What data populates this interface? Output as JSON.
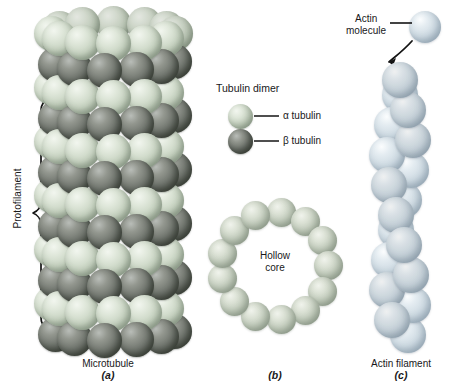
{
  "figure": {
    "type": "biology-diagram",
    "background": "#ffffff"
  },
  "panels": [
    {
      "id": "a",
      "letter": "(a)",
      "caption": "Microtubule"
    },
    {
      "id": "b",
      "letter": "(b)",
      "caption": ""
    },
    {
      "id": "c",
      "letter": "(c)",
      "caption": "Actin filament"
    }
  ],
  "microtubule": {
    "annotation": "Protofilament",
    "bracket": "curly-brace",
    "rows": 12,
    "columns": 6,
    "subunit_pattern": "alternating alpha and beta tubulin rows"
  },
  "legend": {
    "title": "Tubulin dimer",
    "items": [
      {
        "label": "α tubulin",
        "color": "#c6d2c0",
        "name": "alpha-tubulin"
      },
      {
        "label": "β tubulin",
        "color": "#6e736c",
        "name": "beta-tubulin"
      }
    ]
  },
  "cross_section": {
    "label_line1": "Hollow",
    "label_line2": "core",
    "subunit_count": 13,
    "color": "#c3cdbd"
  },
  "actin_filament": {
    "molecule_label_line1": "Actin",
    "molecule_label_line2": "molecule",
    "arrow": "curved-arrow-incorporation",
    "leader": "leader-line",
    "strand_count": 2,
    "subunits_per_strand": 9,
    "color": "#cfdbe3"
  },
  "colors": {
    "alpha_tubulin": "#c6d2c0",
    "beta_tubulin": "#6e736c",
    "ring_subunit": "#c3cdbd",
    "actin_subunit": "#cfdbe3",
    "text": "#18181a",
    "line": "#111111"
  }
}
